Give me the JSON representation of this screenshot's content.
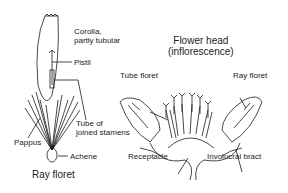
{
  "diagram": {
    "left": {
      "title": "Ray floret",
      "labels": {
        "corolla_line1": "Corolla,",
        "corolla_line2": "partly tubular",
        "pistil": "Pistil",
        "tube_line1": "Tube of",
        "tube_line2": "joined stamens",
        "pappus": "Pappus",
        "achene": "Achene"
      }
    },
    "right": {
      "title_line1": "Flower head",
      "title_line2": "(inflorescence)",
      "labels": {
        "tube_floret": "Tube floret",
        "ray_floret": "Ray floret",
        "receptacle": "Receptacle",
        "involucral_bract": "Involucral bract"
      }
    },
    "colors": {
      "line": "#1a1a1a",
      "background": "#ffffff"
    }
  }
}
